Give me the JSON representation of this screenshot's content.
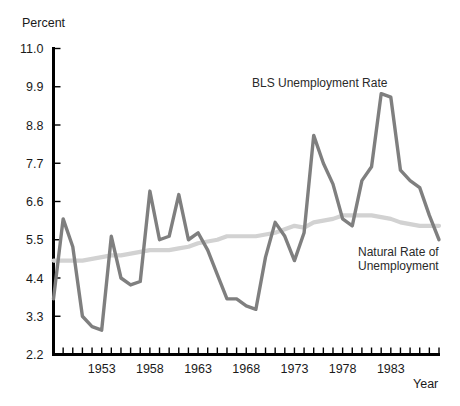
{
  "chart_data": {
    "type": "line",
    "title": "",
    "xlabel": "Year",
    "ylabel": "Percent",
    "xlim": [
      1948,
      1988
    ],
    "ylim": [
      2.2,
      11.0
    ],
    "grid": false,
    "legend_position": "inline-annotations",
    "y_ticks": [
      "2.2",
      "3.3",
      "4.4",
      "5.5",
      "6.6",
      "7.7",
      "8.8",
      "9.9",
      "11.0"
    ],
    "y_tick_values": [
      2.2,
      3.3,
      4.4,
      5.5,
      6.6,
      7.7,
      8.8,
      9.9,
      11.0
    ],
    "x_ticks": [
      "1953",
      "1958",
      "1963",
      "1968",
      "1973",
      "1978",
      "1983"
    ],
    "x_tick_values": [
      1953,
      1958,
      1963,
      1968,
      1973,
      1978,
      1983
    ],
    "x_minor_tick_interval": 1,
    "x": [
      1948,
      1949,
      1950,
      1951,
      1952,
      1953,
      1954,
      1955,
      1956,
      1957,
      1958,
      1959,
      1960,
      1961,
      1962,
      1963,
      1964,
      1965,
      1966,
      1967,
      1968,
      1969,
      1970,
      1971,
      1972,
      1973,
      1974,
      1975,
      1976,
      1977,
      1978,
      1979,
      1980,
      1981,
      1982,
      1983,
      1984,
      1985,
      1986,
      1987,
      1988
    ],
    "series": [
      {
        "name": "BLS Unemployment Rate",
        "color": "#7f7f7f",
        "values": [
          3.8,
          6.1,
          5.3,
          3.3,
          3.0,
          2.9,
          5.6,
          4.4,
          4.2,
          4.3,
          6.9,
          5.5,
          5.6,
          6.8,
          5.5,
          5.7,
          5.2,
          4.5,
          3.8,
          3.8,
          3.6,
          3.5,
          5.0,
          6.0,
          5.6,
          4.9,
          5.7,
          8.5,
          7.7,
          7.1,
          6.1,
          5.9,
          7.2,
          7.6,
          9.7,
          9.6,
          7.5,
          7.2,
          7.0,
          6.2,
          5.5
        ]
      },
      {
        "name": "Natural Rate of Unemployment",
        "color": "#d2d2d2",
        "values": [
          4.9,
          4.9,
          4.9,
          4.9,
          4.95,
          5.0,
          5.05,
          5.05,
          5.1,
          5.15,
          5.2,
          5.2,
          5.2,
          5.25,
          5.3,
          5.4,
          5.45,
          5.5,
          5.6,
          5.6,
          5.6,
          5.6,
          5.65,
          5.7,
          5.8,
          5.9,
          5.85,
          6.0,
          6.05,
          6.1,
          6.2,
          6.2,
          6.2,
          6.2,
          6.15,
          6.1,
          6.0,
          5.95,
          5.9,
          5.9,
          5.9
        ]
      }
    ],
    "annotations": [
      {
        "text": "BLS Unemployment Rate",
        "x_px": 252,
        "y_px": 87
      },
      {
        "text": "Natural Rate of Unemployment",
        "line1": "Natural Rate of",
        "line2": "Unemployment",
        "x_px": 358,
        "y_px": 256
      }
    ]
  },
  "labels": {
    "y_axis_title": "Percent",
    "x_axis_title": "Year",
    "bls_label": "BLS Unemployment Rate",
    "natural_label_line1": "Natural Rate of",
    "natural_label_line2": "Unemployment"
  },
  "colors": {
    "bls_line": "#7f7f7f",
    "natural_line": "#d2d2d2",
    "axis": "#000000",
    "text": "#1a1a1a",
    "background": "#ffffff"
  }
}
